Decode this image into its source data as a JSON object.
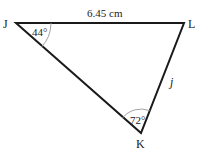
{
  "diagram": {
    "type": "triangle",
    "vertices": {
      "J": {
        "label": "J",
        "angle": "44°"
      },
      "L": {
        "label": "L"
      },
      "K": {
        "label": "K",
        "angle": "72°"
      }
    },
    "sides": {
      "JL": {
        "label": "6.45 cm"
      },
      "LK": {
        "label": "j"
      }
    },
    "colors": {
      "line": "#1a1a1a",
      "arc": "#999999",
      "text": "#222222"
    }
  }
}
